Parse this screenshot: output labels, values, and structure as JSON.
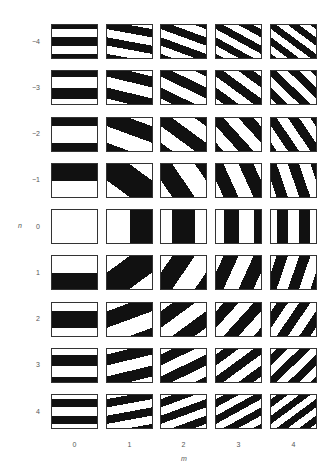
{
  "figure": {
    "row_axis_label": "n",
    "col_axis_label": "m",
    "rows": [
      {
        "n": -4,
        "label": "−4"
      },
      {
        "n": -3,
        "label": "−3"
      },
      {
        "n": -2,
        "label": "−2"
      },
      {
        "n": -1,
        "label": "−1"
      },
      {
        "n": 0,
        "label": "0"
      },
      {
        "n": 1,
        "label": "1"
      },
      {
        "n": 2,
        "label": "2"
      },
      {
        "n": 3,
        "label": "3"
      },
      {
        "n": 4,
        "label": "4"
      }
    ],
    "columns": [
      {
        "m": 0,
        "label": "0"
      },
      {
        "m": 1,
        "label": "1"
      },
      {
        "m": 2,
        "label": "2"
      },
      {
        "m": 3,
        "label": "3"
      },
      {
        "m": 4,
        "label": "4"
      }
    ],
    "colors": {
      "stripe": "#111111",
      "background": "#ffffff",
      "border": "#333333",
      "label": "#555555"
    }
  }
}
